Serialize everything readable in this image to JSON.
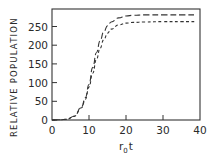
{
  "chart_data": {
    "type": "line",
    "title": "",
    "xlabel": "r0t",
    "xlabel_main": "r",
    "xlabel_sub": "0",
    "xlabel_tail": "t",
    "ylabel": "RELATIVE POPULATION",
    "xlim": [
      0,
      40
    ],
    "ylim": [
      0,
      300
    ],
    "xticks": [
      0,
      10,
      20,
      30,
      40
    ],
    "yticks": [
      0,
      50,
      100,
      150,
      200,
      250
    ],
    "grid": false,
    "legend": null,
    "series": [
      {
        "name": "long-dashed curve",
        "style": "long-dash",
        "x": [
          0,
          2,
          4,
          6,
          8,
          9,
          10,
          11,
          12,
          13,
          14,
          15,
          16,
          18,
          20,
          22,
          25,
          30,
          35,
          39
        ],
        "values": [
          0,
          0.5,
          2,
          10,
          35,
          60,
          95,
          140,
          180,
          212,
          236,
          252,
          262,
          273,
          278,
          280,
          281,
          281,
          281,
          281
        ]
      },
      {
        "name": "short-dashed curve",
        "style": "short-dash",
        "x": [
          0,
          2,
          4,
          6,
          8,
          9,
          10,
          11,
          12,
          13,
          14,
          15,
          16,
          18,
          20,
          22,
          25,
          30,
          35,
          39
        ],
        "values": [
          0,
          0.5,
          2,
          10,
          33,
          55,
          88,
          125,
          162,
          192,
          215,
          232,
          243,
          254,
          259,
          261,
          262,
          263,
          263,
          263
        ]
      }
    ]
  },
  "axes": {
    "y_title": "RELATIVE POPULATION",
    "y_ticks": [
      "0",
      "50",
      "100",
      "150",
      "200",
      "250"
    ],
    "x_ticks": [
      "0",
      "10",
      "20",
      "30",
      "40"
    ],
    "x_title_main": "r",
    "x_title_sub": "0",
    "x_title_tail": "t"
  },
  "colors": {
    "ink": "#2a2a2a",
    "background": "#ffffff"
  }
}
